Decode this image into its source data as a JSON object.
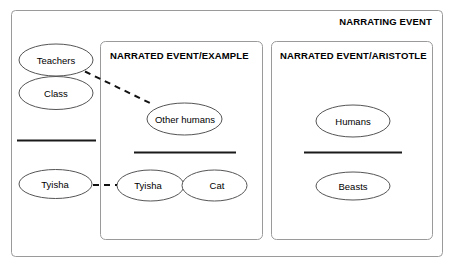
{
  "diagram": {
    "outer_frame": {
      "label": "NARRATING EVENT"
    },
    "inner_frames": [
      {
        "label": "NARRATED EVENT/EXAMPLE"
      },
      {
        "label": "NARRATED EVENT/ARISTOTLE"
      }
    ],
    "nodes": {
      "narrating_teachers": "Teachers",
      "narrating_class": "Class",
      "narrating_tyisha": "Tyisha",
      "example_other_humans": "Other humans",
      "example_tyisha": "Tyisha",
      "example_cat": "Cat",
      "aristotle_humans": "Humans",
      "aristotle_beasts": "Beasts"
    },
    "colors": {
      "background": "#ffffff",
      "frame_stroke": "#9a9a9a",
      "ellipse_stroke": "#555555",
      "divider": "#1a1a1a",
      "connector": "#111111",
      "text": "#000000"
    }
  }
}
